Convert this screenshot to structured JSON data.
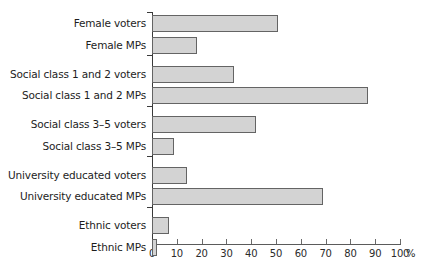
{
  "chart_data": {
    "type": "bar",
    "orientation": "horizontal",
    "title": "",
    "xlabel": "%",
    "ylabel": "",
    "xlim": [
      0,
      100
    ],
    "grid": false,
    "legend": null,
    "unit_suffix": "%",
    "categories": [
      "Female voters",
      "Female MPs",
      "Social class 1 and 2 voters",
      "Social class 1 and 2 MPs",
      "Social class 3–5 voters",
      "Social class 3–5 MPs",
      "University educated voters",
      "University educated MPs",
      "Ethnic voters",
      "Ethnic MPs"
    ],
    "values": [
      51,
      18,
      33,
      87,
      42,
      9,
      14,
      69,
      7,
      2
    ],
    "xticks": [
      0,
      10,
      20,
      30,
      40,
      50,
      60,
      70,
      80,
      90,
      100
    ],
    "xtick_labels": [
      "0",
      "10",
      "20",
      "30",
      "40",
      "50",
      "60",
      "70",
      "80",
      "90",
      "100"
    ],
    "group_breaks": [
      2,
      4,
      6,
      8
    ],
    "bar_fill_color": "#d3d3d3",
    "bar_edge_color": "#646464",
    "axis_color": "#3a3a3a",
    "text_color": "#1d1d1d",
    "background_color": "#ffffff"
  }
}
